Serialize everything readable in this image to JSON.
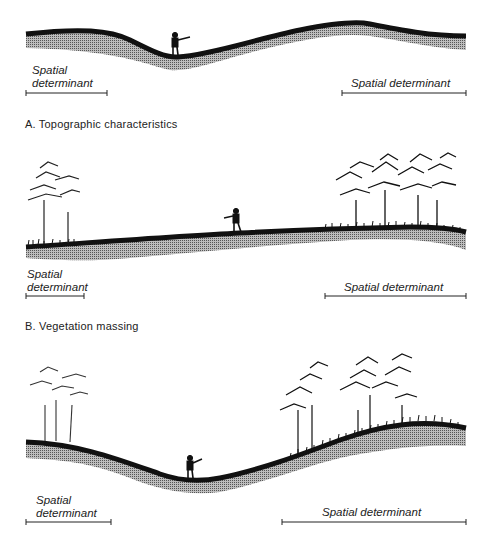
{
  "panels": [
    {
      "id": "A",
      "caption": "A.  Topographic characteristics",
      "left_label": [
        "Spatial",
        "determinant"
      ],
      "right_label": "Spatial determinant"
    },
    {
      "id": "B",
      "caption": "B.  Vegetation massing",
      "left_label": [
        "Spatial",
        "determinant"
      ],
      "right_label": "Spatial determinant"
    },
    {
      "id": "C",
      "caption": "",
      "left_label": [
        "Spatial",
        "determinant"
      ],
      "right_label": "Spatial determinant"
    }
  ],
  "colors": {
    "ground": "#111111",
    "shade": "#9a9a9a",
    "text": "#222222"
  }
}
